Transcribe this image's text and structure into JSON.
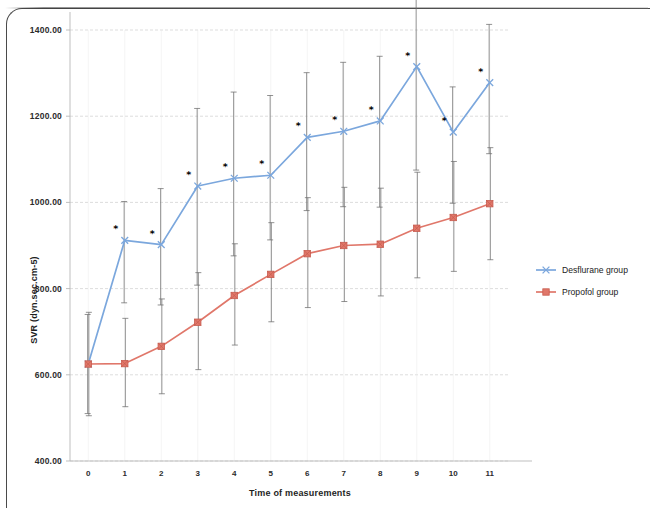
{
  "figure": {
    "axis_title_y": "SVR (dyn.sec.cm-5)",
    "axis_title_x": "Time of measurements"
  },
  "legend": {
    "position": "right",
    "items": [
      {
        "label": "Desflurane group",
        "color": "#7ba7dd",
        "marker": "x"
      },
      {
        "label": "Propofol group",
        "color": "#e0776a",
        "marker": "square"
      }
    ]
  },
  "chart_data": {
    "type": "line",
    "title": "",
    "subtitle": "",
    "xlabel": "Time of measurements",
    "ylabel": "SVR (dyn.sec.cm-5)",
    "x": [
      0,
      1,
      2,
      3,
      4,
      5,
      6,
      7,
      8,
      9,
      10,
      11
    ],
    "xtick_labels": [
      "0",
      "1",
      "2",
      "3",
      "4",
      "5",
      "6",
      "7",
      "8",
      "9",
      "10",
      "11"
    ],
    "ytick_labels": [
      "400.00",
      "600.00",
      "800.00",
      "1000.00",
      "1200.00",
      "1400.00"
    ],
    "yticks": [
      400,
      600,
      800,
      1000,
      1200,
      1400
    ],
    "ylim": [
      400,
      1400
    ],
    "xlim": [
      -0.5,
      11.5
    ],
    "grid": true,
    "error_bars": "SD",
    "annotation_symbol": "*",
    "annotation_note": "* marks significant difference between groups",
    "series": [
      {
        "name": "Desflurane group",
        "color": "#7ba7dd",
        "marker": "x",
        "values": [
          625,
          912,
          902,
          1038,
          1056,
          1063,
          1151,
          1165,
          1189,
          1315,
          1163,
          1278
        ],
        "err_low": [
          115,
          145,
          140,
          230,
          180,
          150,
          170,
          175,
          200,
          240,
          165,
          165
        ],
        "err_high": [
          115,
          90,
          130,
          180,
          200,
          185,
          150,
          160,
          150,
          160,
          105,
          135
        ],
        "starred": [
          false,
          true,
          true,
          true,
          true,
          true,
          true,
          true,
          true,
          true,
          true,
          true
        ]
      },
      {
        "name": "Propofol group",
        "color": "#e0776a",
        "marker": "square",
        "values": [
          625,
          626,
          666,
          722,
          784,
          833,
          881,
          900,
          903,
          940,
          965,
          997
        ],
        "err_low": [
          120,
          100,
          110,
          110,
          115,
          110,
          125,
          130,
          120,
          115,
          125,
          130
        ],
        "err_high": [
          120,
          105,
          110,
          115,
          120,
          120,
          130,
          135,
          130,
          130,
          130,
          130
        ]
      }
    ]
  }
}
